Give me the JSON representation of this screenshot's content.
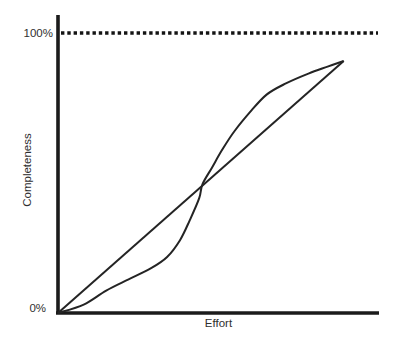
{
  "figure": {
    "y_axis_label": "Completeness",
    "x_axis_label": "Effort",
    "y_tick_top": "100%",
    "y_tick_bottom": "0%"
  },
  "chart_data": {
    "type": "line",
    "title": "",
    "xlabel": "Effort",
    "ylabel": "Completeness",
    "xlim": [
      0,
      100
    ],
    "ylim": [
      0,
      100
    ],
    "grid": false,
    "legend": "none",
    "y_ticks": [
      {
        "value": 100,
        "label": "100%"
      },
      {
        "value": 0,
        "label": "0%"
      }
    ],
    "reference_line": {
      "y": 100,
      "style": "dotted"
    },
    "series": [
      {
        "name": "straight-line",
        "style": "solid",
        "points": [
          [
            0,
            0
          ],
          [
            89,
            90
          ]
        ]
      },
      {
        "name": "s-curve",
        "style": "solid",
        "points": [
          [
            0,
            0
          ],
          [
            8,
            3
          ],
          [
            15,
            8
          ],
          [
            22,
            12
          ],
          [
            29,
            16
          ],
          [
            34,
            20
          ],
          [
            38,
            26
          ],
          [
            41,
            33
          ],
          [
            44,
            41
          ],
          [
            45,
            46
          ],
          [
            48,
            52
          ],
          [
            51,
            58
          ],
          [
            55,
            65
          ],
          [
            60,
            72
          ],
          [
            65,
            78
          ],
          [
            71,
            82
          ],
          [
            78,
            85.5
          ],
          [
            84,
            88
          ],
          [
            89,
            90
          ]
        ]
      }
    ],
    "line_color": "#242424",
    "background_color": "#ffffff"
  }
}
